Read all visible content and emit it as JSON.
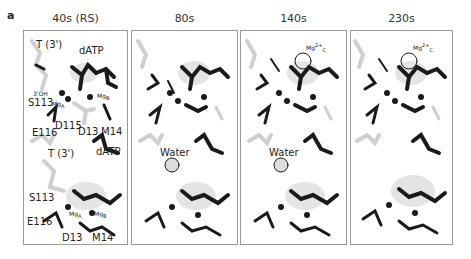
{
  "figure": {
    "panel_letter": "a",
    "columns": [
      {
        "title": "40s (RS)"
      },
      {
        "title": "80s"
      },
      {
        "title": "140s"
      },
      {
        "title": "230s"
      }
    ],
    "panel1_labels": {
      "top": {
        "t3": "T (3')",
        "datp": "dATP",
        "oh": "3'OH",
        "s113": "S113",
        "mga": "Mg",
        "mgb": "Mg",
        "e116": "E116",
        "d115": "D115",
        "d13": "D13",
        "m14": "M14"
      },
      "bottom": {
        "t3": "T (3')",
        "datp": "dATP",
        "s113": "S113",
        "e116": "E116",
        "mga": "Mg",
        "mgb": "Mg",
        "d13": "D13",
        "m14": "M14"
      }
    },
    "annotations": {
      "water": "Water",
      "mgc": "Mg",
      "mg_charge": "2+",
      "sub_a": "A",
      "sub_b": "B",
      "sub_c": "C"
    },
    "colors": {
      "border": "#9a9a9a",
      "atom_dark": "#1a1a1a",
      "atom_light": "#cfcfcf",
      "density": "#bdbdbd"
    }
  }
}
